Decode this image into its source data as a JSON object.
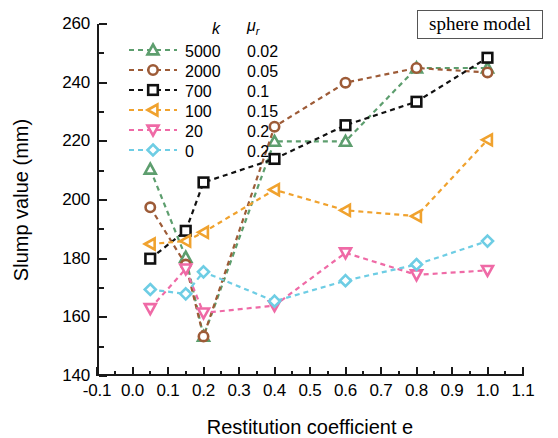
{
  "annotation": {
    "text": "sphere model"
  },
  "legend": {
    "header_k": "k",
    "header_mu": "μ",
    "header_mu_sub": "r",
    "items": [
      {
        "k": "5000",
        "mu": "0.02",
        "color": "#5d9e6e",
        "marker": "triangle-up"
      },
      {
        "k": "2000",
        "mu": "0.05",
        "color": "#9d5b37",
        "marker": "circle"
      },
      {
        "k": "700",
        "mu": "0.1",
        "color": "#111111",
        "marker": "square"
      },
      {
        "k": "100",
        "mu": "0.15",
        "color": "#f0a22e",
        "marker": "triangle-left"
      },
      {
        "k": "20",
        "mu": "0.2",
        "color": "#ef6aa6",
        "marker": "triangle-down"
      },
      {
        "k": "0",
        "mu": "0.2",
        "color": "#6ecde4",
        "marker": "diamond"
      }
    ]
  },
  "chart_data": {
    "type": "line",
    "title": "",
    "subtitle": "",
    "xlabel": "Restitution coefficient e",
    "ylabel": "Slump value (mm)",
    "xlim": [
      -0.1,
      1.1
    ],
    "ylim": [
      140,
      260
    ],
    "xticks": [
      "-0.1",
      "0.0",
      "0.1",
      "0.2",
      "0.3",
      "0.4",
      "0.5",
      "0.6",
      "0.7",
      "0.8",
      "0.9",
      "1.0",
      "1.1"
    ],
    "xtick_values": [
      -0.1,
      0.0,
      0.1,
      0.2,
      0.3,
      0.4,
      0.5,
      0.6,
      0.7,
      0.8,
      0.9,
      1.0,
      1.1
    ],
    "yticks": [
      "140",
      "160",
      "180",
      "200",
      "220",
      "240",
      "260"
    ],
    "ytick_values": [
      140,
      160,
      180,
      200,
      220,
      240,
      260
    ],
    "grid": false,
    "minor_ticks": true,
    "legend_position": "upper-left-inside",
    "linestyle": "dashed",
    "annotations": [
      "sphere model"
    ],
    "series": [
      {
        "name": "k = 5000, μ_r = 0.02",
        "k": 5000,
        "mu_r": 0.02,
        "color": "#5d9e6e",
        "marker": "triangle-up",
        "x": [
          0.05,
          0.15,
          0.2,
          0.4,
          0.6,
          0.8,
          1.0
        ],
        "y": [
          210.5,
          180.5,
          153.5,
          220.0,
          220.0,
          245.0,
          245.0
        ]
      },
      {
        "name": "k = 2000, μ_r = 0.05",
        "k": 2000,
        "mu_r": 0.05,
        "color": "#9d5b37",
        "marker": "circle",
        "x": [
          0.05,
          0.15,
          0.2,
          0.4,
          0.6,
          0.8,
          1.0
        ],
        "y": [
          197.5,
          178.0,
          153.5,
          225.0,
          240.0,
          245.0,
          243.5
        ]
      },
      {
        "name": "k = 700, μ_r = 0.1",
        "k": 700,
        "mu_r": 0.1,
        "color": "#111111",
        "marker": "square",
        "x": [
          0.05,
          0.15,
          0.2,
          0.4,
          0.6,
          0.8,
          1.0
        ],
        "y": [
          180.0,
          189.5,
          206.0,
          214.0,
          225.5,
          233.5,
          248.5
        ]
      },
      {
        "name": "k = 100, μ_r = 0.15",
        "k": 100,
        "mu_r": 0.15,
        "color": "#f0a22e",
        "marker": "triangle-left",
        "x": [
          0.05,
          0.15,
          0.2,
          0.4,
          0.6,
          0.8,
          1.0
        ],
        "y": [
          185.0,
          186.0,
          189.0,
          203.5,
          196.5,
          194.5,
          220.5
        ]
      },
      {
        "name": "k = 20, μ_r = 0.2",
        "k": 20,
        "mu_r": 0.2,
        "color": "#ef6aa6",
        "marker": "triangle-down",
        "x": [
          0.05,
          0.15,
          0.2,
          0.4,
          0.6,
          0.8,
          1.0
        ],
        "y": [
          163.0,
          176.5,
          161.5,
          164.0,
          182.0,
          174.5,
          176.0
        ]
      },
      {
        "name": "k = 0, μ_r = 0.2",
        "k": 0,
        "mu_r": 0.2,
        "color": "#6ecde4",
        "marker": "diamond",
        "x": [
          0.05,
          0.15,
          0.2,
          0.4,
          0.6,
          0.8,
          1.0
        ],
        "y": [
          169.5,
          168.0,
          175.5,
          165.5,
          172.5,
          178.0,
          186.0
        ]
      }
    ]
  }
}
